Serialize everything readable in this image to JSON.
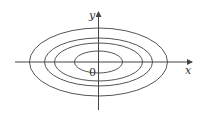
{
  "figure": {
    "type": "contour-ellipses",
    "axes": {
      "x_label": "x",
      "y_label": "y",
      "origin_label": "0"
    },
    "ellipses": [
      {
        "name": "outer",
        "rx": 69,
        "ry": 34
      },
      {
        "name": "second",
        "rx": 54,
        "ry": 24
      },
      {
        "name": "third",
        "rx": 44,
        "ry": 19
      },
      {
        "name": "inner",
        "rx": 24,
        "ry": 11
      }
    ],
    "stroke_color": "#555555"
  }
}
